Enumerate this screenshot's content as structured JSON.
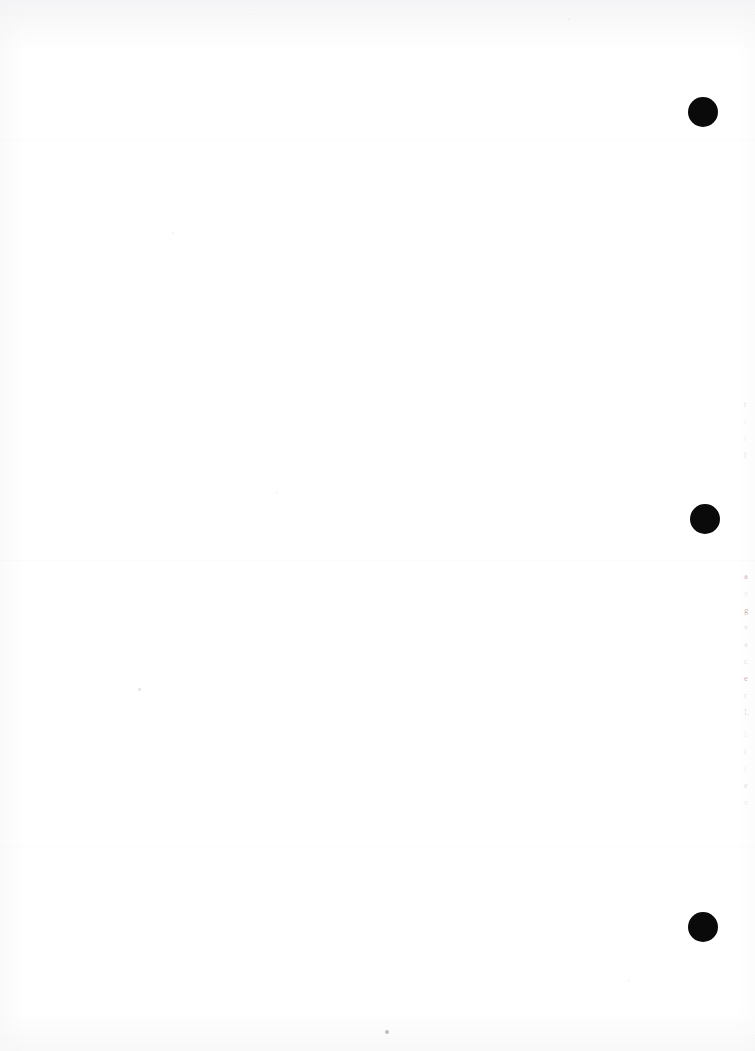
{
  "page": {
    "label": "scanned-blank-page",
    "width": 755,
    "height": 1051,
    "background_color": "#ffffff",
    "ink_color": "#0a0a0a",
    "orientation": "portrait",
    "content_summary": "Blank scanned book page with three solid black registration dots in the right margin and faint clipped text at the right edge."
  },
  "registration_dots": [
    {
      "name": "top",
      "x": 688,
      "y": 97,
      "diameter": 30,
      "color": "#0a0a0a"
    },
    {
      "name": "middle",
      "x": 690,
      "y": 504,
      "diameter": 30,
      "color": "#0a0a0a"
    },
    {
      "name": "bottom",
      "x": 688,
      "y": 912,
      "diameter": 30,
      "color": "#0a0a0a"
    }
  ],
  "edge_text": {
    "upper": [
      {
        "text": "t",
        "opacity": "faint"
      },
      {
        "text": "i",
        "opacity": "very-faint"
      },
      {
        "text": "r",
        "opacity": "very-faint"
      },
      {
        "text": "l",
        "opacity": "faint"
      }
    ],
    "main": [
      {
        "text": "a",
        "opacity": "normal"
      },
      {
        "text": "n",
        "opacity": "very-faint"
      },
      {
        "text": "g",
        "opacity": "normal"
      },
      {
        "text": "v",
        "opacity": "faint"
      },
      {
        "text": "a",
        "opacity": "faint"
      },
      {
        "text": "c",
        "opacity": "faint"
      },
      {
        "text": "e",
        "opacity": "normal"
      },
      {
        "text": "r",
        "opacity": "faint"
      },
      {
        "text": "L",
        "opacity": "faint"
      }
    ],
    "lower": [
      {
        "text": "l",
        "opacity": "very-faint"
      },
      {
        "text": "i",
        "opacity": "faint"
      },
      {
        "text": "t",
        "opacity": "very-faint"
      },
      {
        "text": "e",
        "opacity": "faint"
      },
      {
        "text": "n",
        "opacity": "very-faint"
      }
    ]
  },
  "specks": [
    {
      "name": "center-bottom-speck",
      "x": 385,
      "y": 1030,
      "size": 4,
      "opacity": "normal"
    },
    {
      "name": "mid-left-speck",
      "x": 138,
      "y": 688,
      "size": 2.5,
      "opacity": "light"
    },
    {
      "name": "upper-left-speck",
      "x": 172,
      "y": 232,
      "size": 2,
      "opacity": "faint"
    },
    {
      "name": "lower-center-speck",
      "x": 628,
      "y": 980,
      "size": 2,
      "opacity": "faint"
    },
    {
      "name": "mid-center-speck",
      "x": 276,
      "y": 492,
      "size": 2,
      "opacity": "faint"
    },
    {
      "name": "upper-right-speck",
      "x": 568,
      "y": 18,
      "size": 2,
      "opacity": "faint"
    }
  ],
  "streaks": [
    {
      "name": "streak-top",
      "y": 14
    },
    {
      "name": "streak-upper",
      "y": 140
    },
    {
      "name": "streak-mid",
      "y": 560
    },
    {
      "name": "streak-lower",
      "y": 846
    },
    {
      "name": "streak-bottom",
      "y": 1038
    }
  ]
}
